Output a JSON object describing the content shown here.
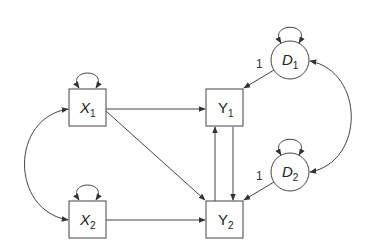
{
  "diagram": {
    "type": "path-diagram",
    "colors": {
      "stroke": "#444444",
      "text": "#222222",
      "background": "#ffffff"
    },
    "nodes": [
      {
        "id": "X1",
        "shape": "box",
        "var": "X",
        "sub": "1",
        "x": 69,
        "y": 89,
        "w": 37,
        "h": 37
      },
      {
        "id": "X2",
        "shape": "box",
        "var": "X",
        "sub": "2",
        "x": 69,
        "y": 201,
        "w": 37,
        "h": 37
      },
      {
        "id": "Y1",
        "shape": "box",
        "var": "Y",
        "sub": "1",
        "x": 206,
        "y": 89,
        "w": 37,
        "h": 37
      },
      {
        "id": "Y2",
        "shape": "box",
        "var": "Y",
        "sub": "2",
        "x": 206,
        "y": 201,
        "w": 37,
        "h": 37
      },
      {
        "id": "D1",
        "shape": "circle",
        "var": "D",
        "sub": "1",
        "cx": 290,
        "cy": 60,
        "r": 19
      },
      {
        "id": "D2",
        "shape": "circle",
        "var": "D",
        "sub": "2",
        "cx": 290,
        "cy": 172,
        "r": 19
      }
    ],
    "edges": [
      {
        "from": "X1",
        "to": "Y1",
        "kind": "directed"
      },
      {
        "from": "X1",
        "to": "Y2",
        "kind": "directed"
      },
      {
        "from": "X2",
        "to": "Y2",
        "kind": "directed"
      },
      {
        "from": "Y1",
        "to": "Y2",
        "kind": "directed"
      },
      {
        "from": "Y2",
        "to": "Y1",
        "kind": "directed"
      },
      {
        "from": "D1",
        "to": "Y1",
        "kind": "directed",
        "label": "1"
      },
      {
        "from": "D2",
        "to": "Y2",
        "kind": "directed",
        "label": "1"
      },
      {
        "from": "X1",
        "to": "X2",
        "kind": "covariance"
      },
      {
        "from": "D1",
        "to": "D2",
        "kind": "covariance"
      },
      {
        "from": "X1",
        "to": "X1",
        "kind": "variance"
      },
      {
        "from": "X2",
        "to": "X2",
        "kind": "variance"
      },
      {
        "from": "D1",
        "to": "D1",
        "kind": "variance"
      },
      {
        "from": "D2",
        "to": "D2",
        "kind": "variance"
      }
    ],
    "labels": {
      "X1": {
        "var": "X",
        "sub": "1"
      },
      "X2": {
        "var": "X",
        "sub": "2"
      },
      "Y1": {
        "var": "Y",
        "sub": "1"
      },
      "Y2": {
        "var": "Y",
        "sub": "2"
      },
      "D1": {
        "var": "D",
        "sub": "1"
      },
      "D2": {
        "var": "D",
        "sub": "2"
      },
      "d1_y1_loading": "1",
      "d2_y2_loading": "1"
    }
  }
}
